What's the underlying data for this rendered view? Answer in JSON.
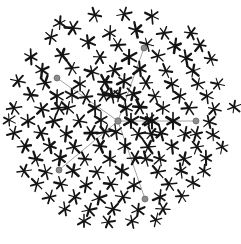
{
  "figure": {
    "type": "glyph-scatter",
    "width": 241,
    "height": 244,
    "background_color": "#ffffff",
    "glyph_color": "#141414",
    "node_color": "#8c8c8c",
    "edge_color": "#9a9a9a",
    "glyph_shape": "six-armed-asterisk",
    "glyph_count": 131,
    "arm_count": 6,
    "boundary_shape": "circle",
    "boundary_center": [
      118,
      121
    ],
    "boundary_radius": 114
  },
  "chart_data": {
    "type": "scatter",
    "subtitle": "",
    "xlabel": "",
    "ylabel": "",
    "xlim": [
      0,
      241
    ],
    "ylim": [
      0,
      244
    ],
    "grid": false,
    "legend": "none",
    "annotations": [],
    "marker_style": "six-armed asterisk, randomized rotation and arm weight",
    "glyphs": [
      {
        "x": 95,
        "y": 15,
        "r": 7.6,
        "rot": 12,
        "w": 1.7
      },
      {
        "x": 124,
        "y": 14,
        "r": 7.3,
        "rot": 48,
        "w": 1.6
      },
      {
        "x": 152,
        "y": 16,
        "r": 7.5,
        "rot": 25,
        "w": 1.8
      },
      {
        "x": 73,
        "y": 28,
        "r": 7.8,
        "rot": 5,
        "w": 2.1
      },
      {
        "x": 110,
        "y": 33,
        "r": 7.4,
        "rot": 33,
        "w": 1.6
      },
      {
        "x": 136,
        "y": 30,
        "r": 7.7,
        "rot": 18,
        "w": 2.0
      },
      {
        "x": 164,
        "y": 33,
        "r": 7.2,
        "rot": 52,
        "w": 1.7
      },
      {
        "x": 191,
        "y": 33,
        "r": 7.0,
        "rot": 7,
        "w": 1.8
      },
      {
        "x": 51,
        "y": 37,
        "r": 7.3,
        "rot": 41,
        "w": 1.6
      },
      {
        "x": 88,
        "y": 42,
        "r": 7.6,
        "rot": 22,
        "w": 1.9
      },
      {
        "x": 118,
        "y": 45,
        "r": 7.4,
        "rot": 56,
        "w": 1.7
      },
      {
        "x": 147,
        "y": 44,
        "r": 7.1,
        "rot": 15,
        "w": 1.6
      },
      {
        "x": 175,
        "y": 46,
        "r": 7.5,
        "rot": 38,
        "w": 2.0
      },
      {
        "x": 200,
        "y": 45,
        "r": 7.2,
        "rot": 9,
        "w": 1.8
      },
      {
        "x": 31,
        "y": 57,
        "r": 7.4,
        "rot": 27,
        "w": 1.9
      },
      {
        "x": 62,
        "y": 55,
        "r": 7.6,
        "rot": 50,
        "w": 2.1
      },
      {
        "x": 100,
        "y": 57,
        "r": 7.3,
        "rot": 3,
        "w": 1.7
      },
      {
        "x": 129,
        "y": 57,
        "r": 7.8,
        "rot": 31,
        "w": 2.2
      },
      {
        "x": 158,
        "y": 56,
        "r": 7.2,
        "rot": 44,
        "w": 1.6
      },
      {
        "x": 186,
        "y": 58,
        "r": 7.4,
        "rot": 20,
        "w": 1.8
      },
      {
        "x": 211,
        "y": 59,
        "r": 6.9,
        "rot": 11,
        "w": 1.6
      },
      {
        "x": 42,
        "y": 70,
        "r": 7.5,
        "rot": 36,
        "w": 1.9
      },
      {
        "x": 72,
        "y": 68,
        "r": 7.3,
        "rot": 54,
        "w": 1.7
      },
      {
        "x": 92,
        "y": 72,
        "r": 7.6,
        "rot": 17,
        "w": 2.0
      },
      {
        "x": 114,
        "y": 70,
        "r": 7.4,
        "rot": 46,
        "w": 1.8
      },
      {
        "x": 140,
        "y": 69,
        "r": 7.7,
        "rot": 24,
        "w": 2.1
      },
      {
        "x": 166,
        "y": 71,
        "r": 7.1,
        "rot": 8,
        "w": 1.6
      },
      {
        "x": 193,
        "y": 71,
        "r": 7.3,
        "rot": 40,
        "w": 1.8
      },
      {
        "x": 18,
        "y": 81,
        "r": 7.2,
        "rot": 13,
        "w": 1.7
      },
      {
        "x": 45,
        "y": 83,
        "r": 7.5,
        "rot": 49,
        "w": 1.9
      },
      {
        "x": 80,
        "y": 84,
        "r": 7.4,
        "rot": 29,
        "w": 1.8
      },
      {
        "x": 105,
        "y": 82,
        "r": 7.8,
        "rot": 2,
        "w": 2.2
      },
      {
        "x": 124,
        "y": 81,
        "r": 7.6,
        "rot": 35,
        "w": 2.0
      },
      {
        "x": 146,
        "y": 83,
        "r": 7.3,
        "rot": 57,
        "w": 1.7
      },
      {
        "x": 172,
        "y": 84,
        "r": 7.5,
        "rot": 21,
        "w": 1.9
      },
      {
        "x": 198,
        "y": 84,
        "r": 7.0,
        "rot": 43,
        "w": 1.6
      },
      {
        "x": 31,
        "y": 95,
        "r": 7.4,
        "rot": 6,
        "w": 1.8
      },
      {
        "x": 57,
        "y": 96,
        "r": 7.6,
        "rot": 32,
        "w": 2.0
      },
      {
        "x": 86,
        "y": 97,
        "r": 7.3,
        "rot": 53,
        "w": 1.7
      },
      {
        "x": 112,
        "y": 95,
        "r": 7.7,
        "rot": 19,
        "w": 2.1
      },
      {
        "x": 133,
        "y": 94,
        "r": 7.5,
        "rot": 45,
        "w": 1.9
      },
      {
        "x": 155,
        "y": 96,
        "r": 7.2,
        "rot": 10,
        "w": 1.6
      },
      {
        "x": 180,
        "y": 96,
        "r": 7.4,
        "rot": 37,
        "w": 1.8
      },
      {
        "x": 207,
        "y": 96,
        "r": 7.1,
        "rot": 23,
        "w": 1.7
      },
      {
        "x": 14,
        "y": 108,
        "r": 7.3,
        "rot": 51,
        "w": 1.8
      },
      {
        "x": 42,
        "y": 109,
        "r": 7.5,
        "rot": 16,
        "w": 1.9
      },
      {
        "x": 68,
        "y": 108,
        "r": 7.4,
        "rot": 42,
        "w": 1.8
      },
      {
        "x": 95,
        "y": 108,
        "r": 7.6,
        "rot": 28,
        "w": 2.0
      },
      {
        "x": 140,
        "y": 107,
        "r": 7.8,
        "rot": 4,
        "w": 2.2
      },
      {
        "x": 163,
        "y": 108,
        "r": 7.3,
        "rot": 34,
        "w": 1.7
      },
      {
        "x": 189,
        "y": 108,
        "r": 7.5,
        "rot": 55,
        "w": 1.9
      },
      {
        "x": 214,
        "y": 109,
        "r": 6.9,
        "rot": 14,
        "w": 1.6
      },
      {
        "x": 234,
        "y": 107,
        "r": 6.7,
        "rot": 39,
        "w": 1.5
      },
      {
        "x": 28,
        "y": 121,
        "r": 7.4,
        "rot": 26,
        "w": 1.8
      },
      {
        "x": 54,
        "y": 121,
        "r": 7.6,
        "rot": 47,
        "w": 2.0
      },
      {
        "x": 79,
        "y": 121,
        "r": 7.3,
        "rot": 12,
        "w": 1.7
      },
      {
        "x": 101,
        "y": 120,
        "r": 7.5,
        "rot": 30,
        "w": 1.9
      },
      {
        "x": 131,
        "y": 121,
        "r": 7.9,
        "rot": 90,
        "w": 2.3
      },
      {
        "x": 152,
        "y": 121,
        "r": 7.9,
        "rot": 90,
        "w": 2.3
      },
      {
        "x": 173,
        "y": 121,
        "r": 7.9,
        "rot": 90,
        "w": 2.3
      },
      {
        "x": 209,
        "y": 122,
        "r": 7.0,
        "rot": 18,
        "w": 1.6
      },
      {
        "x": 14,
        "y": 133,
        "r": 7.2,
        "rot": 44,
        "w": 1.7
      },
      {
        "x": 41,
        "y": 133,
        "r": 7.5,
        "rot": 9,
        "w": 1.9
      },
      {
        "x": 66,
        "y": 134,
        "r": 7.4,
        "rot": 36,
        "w": 1.8
      },
      {
        "x": 91,
        "y": 133,
        "r": 7.7,
        "rot": 58,
        "w": 2.1
      },
      {
        "x": 116,
        "y": 132,
        "r": 7.5,
        "rot": 22,
        "w": 1.9
      },
      {
        "x": 138,
        "y": 134,
        "r": 7.3,
        "rot": 48,
        "w": 1.7
      },
      {
        "x": 161,
        "y": 133,
        "r": 7.6,
        "rot": 15,
        "w": 2.0
      },
      {
        "x": 185,
        "y": 134,
        "r": 7.2,
        "rot": 41,
        "w": 1.7
      },
      {
        "x": 213,
        "y": 135,
        "r": 6.9,
        "rot": 27,
        "w": 1.6
      },
      {
        "x": 25,
        "y": 146,
        "r": 7.3,
        "rot": 53,
        "w": 1.8
      },
      {
        "x": 50,
        "y": 146,
        "r": 7.5,
        "rot": 20,
        "w": 1.9
      },
      {
        "x": 74,
        "y": 147,
        "r": 7.4,
        "rot": 46,
        "w": 1.8
      },
      {
        "x": 100,
        "y": 146,
        "r": 7.6,
        "rot": 7,
        "w": 2.0
      },
      {
        "x": 125,
        "y": 146,
        "r": 7.3,
        "rot": 33,
        "w": 1.7
      },
      {
        "x": 148,
        "y": 147,
        "r": 7.5,
        "rot": 55,
        "w": 1.9
      },
      {
        "x": 172,
        "y": 146,
        "r": 7.2,
        "rot": 24,
        "w": 1.7
      },
      {
        "x": 197,
        "y": 147,
        "r": 7.0,
        "rot": 50,
        "w": 1.6
      },
      {
        "x": 36,
        "y": 159,
        "r": 7.4,
        "rot": 11,
        "w": 1.8
      },
      {
        "x": 60,
        "y": 158,
        "r": 7.6,
        "rot": 38,
        "w": 2.0
      },
      {
        "x": 85,
        "y": 159,
        "r": 7.3,
        "rot": 5,
        "w": 1.7
      },
      {
        "x": 110,
        "y": 159,
        "r": 7.5,
        "rot": 31,
        "w": 1.9
      },
      {
        "x": 135,
        "y": 158,
        "r": 7.4,
        "rot": 57,
        "w": 1.8
      },
      {
        "x": 160,
        "y": 159,
        "r": 7.2,
        "rot": 19,
        "w": 1.7
      },
      {
        "x": 184,
        "y": 159,
        "r": 7.3,
        "rot": 43,
        "w": 1.8
      },
      {
        "x": 206,
        "y": 158,
        "r": 6.9,
        "rot": 29,
        "w": 1.6
      },
      {
        "x": 24,
        "y": 171,
        "r": 7.1,
        "rot": 52,
        "w": 1.6
      },
      {
        "x": 46,
        "y": 172,
        "r": 7.4,
        "rot": 16,
        "w": 1.8
      },
      {
        "x": 73,
        "y": 171,
        "r": 7.5,
        "rot": 42,
        "w": 1.9
      },
      {
        "x": 97,
        "y": 172,
        "r": 7.3,
        "rot": 8,
        "w": 1.7
      },
      {
        "x": 122,
        "y": 171,
        "r": 7.6,
        "rot": 35,
        "w": 2.0
      },
      {
        "x": 158,
        "y": 172,
        "r": 7.4,
        "rot": 49,
        "w": 1.8
      },
      {
        "x": 181,
        "y": 171,
        "r": 7.2,
        "rot": 22,
        "w": 1.7
      },
      {
        "x": 37,
        "y": 184,
        "r": 7.2,
        "rot": 45,
        "w": 1.7
      },
      {
        "x": 61,
        "y": 184,
        "r": 7.4,
        "rot": 13,
        "w": 1.8
      },
      {
        "x": 86,
        "y": 185,
        "r": 7.3,
        "rot": 39,
        "w": 1.8
      },
      {
        "x": 111,
        "y": 184,
        "r": 7.5,
        "rot": 6,
        "w": 1.9
      },
      {
        "x": 134,
        "y": 185,
        "r": 7.2,
        "rot": 32,
        "w": 1.7
      },
      {
        "x": 169,
        "y": 184,
        "r": 7.3,
        "rot": 54,
        "w": 1.8
      },
      {
        "x": 193,
        "y": 183,
        "r": 7.0,
        "rot": 25,
        "w": 1.6
      },
      {
        "x": 50,
        "y": 197,
        "r": 7.1,
        "rot": 47,
        "w": 1.6
      },
      {
        "x": 75,
        "y": 197,
        "r": 7.3,
        "rot": 17,
        "w": 1.8
      },
      {
        "x": 99,
        "y": 198,
        "r": 7.4,
        "rot": 40,
        "w": 1.8
      },
      {
        "x": 123,
        "y": 197,
        "r": 7.2,
        "rot": 10,
        "w": 1.7
      },
      {
        "x": 160,
        "y": 197,
        "r": 7.3,
        "rot": 36,
        "w": 1.8
      },
      {
        "x": 182,
        "y": 196,
        "r": 7.0,
        "rot": 56,
        "w": 1.6
      },
      {
        "x": 65,
        "y": 209,
        "r": 7.0,
        "rot": 21,
        "w": 1.6
      },
      {
        "x": 89,
        "y": 210,
        "r": 7.2,
        "rot": 48,
        "w": 1.7
      },
      {
        "x": 113,
        "y": 209,
        "r": 7.3,
        "rot": 14,
        "w": 1.8
      },
      {
        "x": 138,
        "y": 210,
        "r": 7.1,
        "rot": 37,
        "w": 1.7
      },
      {
        "x": 163,
        "y": 209,
        "r": 6.9,
        "rot": 3,
        "w": 1.6
      },
      {
        "x": 84,
        "y": 221,
        "r": 6.9,
        "rot": 30,
        "w": 1.6
      },
      {
        "x": 108,
        "y": 222,
        "r": 7.0,
        "rot": 51,
        "w": 1.6
      },
      {
        "x": 132,
        "y": 221,
        "r": 6.8,
        "rot": 18,
        "w": 1.5
      },
      {
        "x": 156,
        "y": 220,
        "r": 6.7,
        "rot": 44,
        "w": 1.5
      },
      {
        "x": 60,
        "y": 23,
        "r": 6.8,
        "rot": 34,
        "w": 1.6
      },
      {
        "x": 218,
        "y": 84,
        "r": 6.8,
        "rot": 12,
        "w": 1.5
      },
      {
        "x": 222,
        "y": 147,
        "r": 6.7,
        "rot": 41,
        "w": 1.5
      },
      {
        "x": 9,
        "y": 120,
        "r": 6.7,
        "rot": 26,
        "w": 1.5
      },
      {
        "x": 105,
        "y": 132,
        "r": 7.6,
        "rot": 49,
        "w": 2.0
      },
      {
        "x": 126,
        "y": 108,
        "r": 7.7,
        "rot": 23,
        "w": 2.1
      },
      {
        "x": 151,
        "y": 134,
        "r": 7.4,
        "rot": 11,
        "w": 1.8
      },
      {
        "x": 119,
        "y": 95,
        "r": 7.5,
        "rot": 40,
        "w": 1.9
      },
      {
        "x": 104,
        "y": 95,
        "r": 7.4,
        "rot": 7,
        "w": 1.8
      },
      {
        "x": 72,
        "y": 95,
        "r": 7.3,
        "rot": 28,
        "w": 1.7
      },
      {
        "x": 59,
        "y": 108,
        "r": 7.5,
        "rot": 52,
        "w": 1.9
      },
      {
        "x": 148,
        "y": 120,
        "r": 7.4,
        "rot": 20,
        "w": 1.8
      },
      {
        "x": 196,
        "y": 134,
        "r": 7.1,
        "rot": 46,
        "w": 1.6
      },
      {
        "x": 146,
        "y": 159,
        "r": 7.3,
        "rot": 15,
        "w": 1.8
      },
      {
        "x": 204,
        "y": 171,
        "r": 6.8,
        "rot": 38,
        "w": 1.5
      }
    ],
    "nodes": [
      {
        "id": "center",
        "x": 118,
        "y": 121,
        "radius": 3.2,
        "label": "center-node"
      },
      {
        "id": "ray-n",
        "x": 144,
        "y": 48,
        "radius": 3.0,
        "label": "endpoint-north"
      },
      {
        "id": "ray-nw",
        "x": 57,
        "y": 78,
        "radius": 3.0,
        "label": "endpoint-northwest"
      },
      {
        "id": "ray-e",
        "x": 196,
        "y": 121,
        "radius": 3.0,
        "label": "endpoint-east"
      },
      {
        "id": "ray-sw",
        "x": 59,
        "y": 170,
        "radius": 3.0,
        "label": "endpoint-southwest"
      },
      {
        "id": "ray-s",
        "x": 145,
        "y": 199,
        "radius": 3.0,
        "label": "endpoint-south"
      }
    ],
    "edges": [
      {
        "from": "center",
        "to": "ray-n"
      },
      {
        "from": "center",
        "to": "ray-nw"
      },
      {
        "from": "center",
        "to": "ray-e"
      },
      {
        "from": "center",
        "to": "ray-sw"
      },
      {
        "from": "center",
        "to": "ray-s"
      }
    ]
  }
}
